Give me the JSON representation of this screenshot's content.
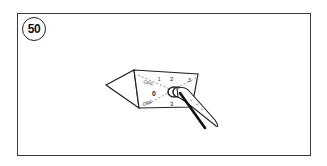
{
  "step": {
    "number": "50"
  },
  "illustration": {
    "subject": "rotary-switch-being-turned-by-hand",
    "dial_labels": {
      "off_top": "OFF",
      "one": "1",
      "two": "2",
      "three": "3",
      "zero": "0",
      "off_bottom": "OFF",
      "bottom": "3"
    },
    "line_color": "#222222"
  }
}
